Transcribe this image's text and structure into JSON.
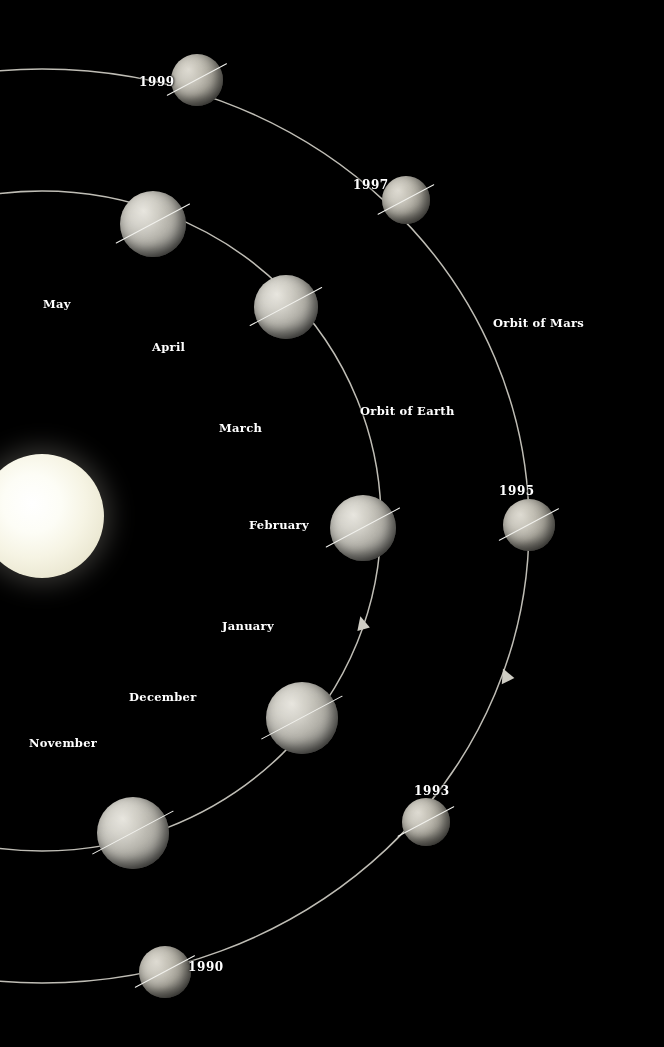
{
  "diagram": {
    "background_color": "#000000",
    "orbit_line_color": "#cfcdc4",
    "label_color": "#ffffff",
    "sun_color": "#f6f4e4"
  },
  "orbit_labels": [
    {
      "id": "orbit-of-mars",
      "text": "Orbit of Mars",
      "x": 493,
      "y": 322
    },
    {
      "id": "orbit-of-earth",
      "text": "Orbit of Earth",
      "x": 360,
      "y": 404
    }
  ],
  "month_labels": [
    {
      "id": "may",
      "text": "May",
      "x": 43,
      "y": 297
    },
    {
      "id": "april",
      "text": "April",
      "x": 152,
      "y": 340
    },
    {
      "id": "march",
      "text": "March",
      "x": 219,
      "y": 421
    },
    {
      "id": "february",
      "text": "February",
      "x": 249,
      "y": 518
    },
    {
      "id": "january",
      "text": "January",
      "x": 222,
      "y": 619
    },
    {
      "id": "december",
      "text": "December",
      "x": 129,
      "y": 690
    },
    {
      "id": "november",
      "text": "November",
      "x": 29,
      "y": 736
    }
  ],
  "year_labels": [
    {
      "id": "1999",
      "text": "1999",
      "x": 139,
      "y": 76
    },
    {
      "id": "1997",
      "text": "1997",
      "x": 353,
      "y": 178
    },
    {
      "id": "1995",
      "text": "1995",
      "x": 499,
      "y": 486
    },
    {
      "id": "1993",
      "text": "1993",
      "x": 414,
      "y": 786
    },
    {
      "id": "1990",
      "text": "1990",
      "x": 188,
      "y": 961
    }
  ],
  "sun": {
    "cx": 42,
    "cy": 516,
    "r": 62
  },
  "earth_positions": [
    {
      "id": "earth-may",
      "cx": 153,
      "cy": 224,
      "r": 33,
      "axis_deg": -28
    },
    {
      "id": "earth-april",
      "cx": 286,
      "cy": 307,
      "r": 32,
      "axis_deg": -28
    },
    {
      "id": "earth-february",
      "cx": 363,
      "cy": 528,
      "r": 33,
      "axis_deg": -28
    },
    {
      "id": "earth-december",
      "cx": 302,
      "cy": 718,
      "r": 36,
      "axis_deg": -28
    },
    {
      "id": "earth-november",
      "cx": 133,
      "cy": 833,
      "r": 36,
      "axis_deg": -28
    }
  ],
  "mars_positions": [
    {
      "id": "mars-1999",
      "cx": 197,
      "cy": 80,
      "r": 26,
      "axis_deg": -28
    },
    {
      "id": "mars-1997",
      "cx": 406,
      "cy": 200,
      "r": 24,
      "axis_deg": -28
    },
    {
      "id": "mars-1995",
      "cx": 529,
      "cy": 525,
      "r": 26,
      "axis_deg": -28
    },
    {
      "id": "mars-1993",
      "cx": 426,
      "cy": 822,
      "r": 24,
      "axis_deg": -28
    },
    {
      "id": "mars-1990",
      "cx": 165,
      "cy": 972,
      "r": 26,
      "axis_deg": -28
    }
  ],
  "direction_arrows": [
    {
      "id": "earth-direction-arrow",
      "x": 362,
      "y": 625,
      "angle_deg": -12
    },
    {
      "id": "mars-direction-arrow",
      "x": 506,
      "y": 677,
      "angle_deg": -22
    }
  ]
}
